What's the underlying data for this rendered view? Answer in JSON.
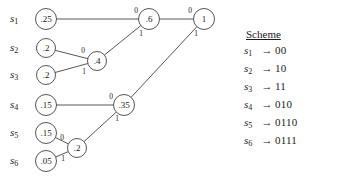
{
  "figure": {
    "type": "huffman-coding-tree",
    "source_labels": [
      {
        "name": "s1",
        "base": "s",
        "sub": "1"
      },
      {
        "name": "s2",
        "base": "s",
        "sub": "2"
      },
      {
        "name": "s3",
        "base": "s",
        "sub": "3"
      },
      {
        "name": "s4",
        "base": "s",
        "sub": "4"
      },
      {
        "name": "s5",
        "base": "s",
        "sub": "5"
      },
      {
        "name": "s6",
        "base": "s",
        "sub": "6"
      }
    ],
    "nodes": [
      {
        "id": "leaf-s1",
        "label": ".25",
        "x": 46,
        "y": 19,
        "r": 10.5
      },
      {
        "id": "leaf-s2",
        "label": ".2",
        "x": 46,
        "y": 48,
        "r": 9.5
      },
      {
        "id": "leaf-s3",
        "label": ".2",
        "x": 46,
        "y": 75,
        "r": 9.5
      },
      {
        "id": "leaf-s4",
        "label": ".15",
        "x": 46,
        "y": 105,
        "r": 10.5
      },
      {
        "id": "leaf-s5",
        "label": ".15",
        "x": 46,
        "y": 133,
        "r": 10.5
      },
      {
        "id": "leaf-s6",
        "label": ".05",
        "x": 46,
        "y": 161,
        "r": 10.5
      },
      {
        "id": "merge-04",
        "label": ".4",
        "x": 97,
        "y": 61,
        "r": 9.5
      },
      {
        "id": "merge-02",
        "label": ".2",
        "x": 77,
        "y": 148,
        "r": 9.5
      },
      {
        "id": "merge-035",
        "label": ".35",
        "x": 124,
        "y": 105,
        "r": 10.5
      },
      {
        "id": "merge-06",
        "label": ".6",
        "x": 149,
        "y": 19,
        "r": 10.5
      },
      {
        "id": "root-1",
        "label": "1",
        "x": 204,
        "y": 19,
        "r": 10.5
      }
    ],
    "edges": [
      {
        "id": "e-s1-06",
        "from": "leaf-s1",
        "to": "merge-06",
        "bit": "0",
        "bit_x": 136,
        "bit_y": 13
      },
      {
        "id": "e-04-06",
        "from": "merge-04",
        "to": "merge-06",
        "bit": "1",
        "bit_x": 141,
        "bit_y": 36
      },
      {
        "id": "e-s2-04",
        "from": "leaf-s2",
        "to": "merge-04",
        "bit": "0",
        "bit_x": 83,
        "bit_y": 53
      },
      {
        "id": "e-s3-04",
        "from": "leaf-s3",
        "to": "merge-04",
        "bit": "1",
        "bit_x": 84,
        "bit_y": 74
      },
      {
        "id": "e-s4-035",
        "from": "leaf-s4",
        "to": "merge-035",
        "bit": "0",
        "bit_x": 111,
        "bit_y": 99
      },
      {
        "id": "e-02-035",
        "from": "merge-02",
        "to": "merge-035",
        "bit": "1",
        "bit_x": 117,
        "bit_y": 121
      },
      {
        "id": "e-s5-02",
        "from": "leaf-s5",
        "to": "merge-02",
        "bit": "0",
        "bit_x": 62,
        "bit_y": 140
      },
      {
        "id": "e-s6-02",
        "from": "leaf-s6",
        "to": "merge-02",
        "bit": "1",
        "bit_x": 63,
        "bit_y": 161
      },
      {
        "id": "e-06-root",
        "from": "merge-06",
        "to": "root-1",
        "bit": "0",
        "bit_x": 190,
        "bit_y": 13
      },
      {
        "id": "e-035-root",
        "from": "merge-035",
        "to": "root-1",
        "bit": "1",
        "bit_x": 196,
        "bit_y": 36
      }
    ]
  },
  "scheme": {
    "title": "Scheme",
    "arrow": "→",
    "rows": [
      {
        "symbol_base": "s",
        "symbol_sub": "1",
        "code": "00"
      },
      {
        "symbol_base": "s",
        "symbol_sub": "2",
        "code": "10"
      },
      {
        "symbol_base": "s",
        "symbol_sub": "3",
        "code": "11"
      },
      {
        "symbol_base": "s",
        "symbol_sub": "4",
        "code": "010"
      },
      {
        "symbol_base": "s",
        "symbol_sub": "5",
        "code": "0110"
      },
      {
        "symbol_base": "s",
        "symbol_sub": "6",
        "code": "0111"
      }
    ]
  },
  "colors": {
    "ink": "#1a1a1a",
    "stroke": "#2b2b2b",
    "background": "#ffffff"
  }
}
